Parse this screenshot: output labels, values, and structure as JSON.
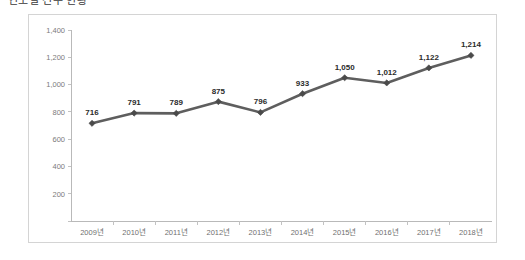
{
  "page": {
    "title": "연도별 건수 현황"
  },
  "chart_data": {
    "type": "line",
    "title": "연도별 건수 현황",
    "categories": [
      "2009년",
      "2010년",
      "2011년",
      "2012년",
      "2013년",
      "2014년",
      "2015년",
      "2016년",
      "2017년",
      "2018년"
    ],
    "values": [
      716,
      791,
      789,
      875,
      796,
      933,
      1050,
      1012,
      1122,
      1214
    ],
    "point_labels": [
      "716",
      "791",
      "789",
      "875",
      "796",
      "933",
      "1,050",
      "1,012",
      "1,122",
      "1,214"
    ],
    "series": [
      {
        "name": "건수",
        "values": [
          716,
          791,
          789,
          875,
          796,
          933,
          1050,
          1012,
          1122,
          1214
        ]
      }
    ],
    "xlabel": "",
    "ylabel": "",
    "ylim": [
      0,
      1400
    ],
    "ytick_values": [
      1400,
      1200,
      1000,
      800,
      600,
      400,
      200
    ],
    "ytick_labels": [
      "1,400",
      "1,200",
      "1,000",
      "800",
      "600",
      "400",
      "200"
    ],
    "grid": false,
    "legend": false,
    "legend_position": "none",
    "line_color": "#5e5e5e",
    "marker_color": "#4a4a4a",
    "marker_shape": "diamond",
    "axis_color": "#b9b9b9",
    "border_color": "#d4d4d4",
    "label_color": "#2b2b2b",
    "tick_label_color": "#7b7b7b"
  }
}
